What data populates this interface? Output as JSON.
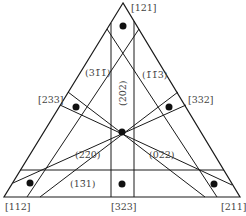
{
  "corners": [
    {
      "id": "top",
      "label": "[121]"
    },
    {
      "id": "left",
      "label": "[112]"
    },
    {
      "id": "right",
      "label": "[211]"
    }
  ],
  "edge_labels": [
    {
      "id": "left-edge",
      "label": "[233]"
    },
    {
      "id": "right-edge",
      "label": "[332]"
    },
    {
      "id": "bottom-edge",
      "label": "[323]"
    }
  ],
  "plane_labels": [
    {
      "id": "p311",
      "label": "(31̄1̄)"
    },
    {
      "id": "p113",
      "label": "(1̄1̄3)"
    },
    {
      "id": "p202",
      "label": "(202)"
    },
    {
      "id": "p220",
      "label": "(22̄0)"
    },
    {
      "id": "p022",
      "label": "(022)"
    },
    {
      "id": "p131",
      "label": "(13̄1)"
    }
  ],
  "dot_count": 7,
  "colors": {
    "line": "#1a1a1a",
    "text": "#444444",
    "dot": "#111111"
  }
}
